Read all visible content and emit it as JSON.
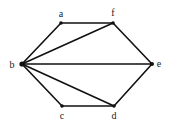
{
  "graph": {
    "vertices": [
      {
        "id": "a",
        "label": "a",
        "x": 61,
        "y": 23,
        "lx": 61,
        "ly": 17,
        "r": 1.8
      },
      {
        "id": "f",
        "label": "f",
        "x": 113,
        "y": 23,
        "lx": 113,
        "ly": 16,
        "r": 1.8
      },
      {
        "id": "b",
        "label": "b",
        "x": 22,
        "y": 64,
        "lx": 12,
        "ly": 68,
        "r": 2.6
      },
      {
        "id": "e",
        "label": "e",
        "x": 152,
        "y": 64,
        "lx": 159,
        "ly": 67,
        "r": 2.0
      },
      {
        "id": "c",
        "label": "c",
        "x": 62,
        "y": 106,
        "lx": 62,
        "ly": 119,
        "r": 1.8
      },
      {
        "id": "d",
        "label": "d",
        "x": 114,
        "y": 106,
        "lx": 114,
        "ly": 119,
        "r": 1.8
      }
    ],
    "edges": [
      [
        "a",
        "f"
      ],
      [
        "a",
        "b"
      ],
      [
        "b",
        "f"
      ],
      [
        "b",
        "e"
      ],
      [
        "b",
        "c"
      ],
      [
        "b",
        "d"
      ],
      [
        "c",
        "d"
      ],
      [
        "d",
        "e"
      ],
      [
        "f",
        "e"
      ]
    ]
  },
  "labels": {
    "a": "a",
    "b": "b",
    "c": "c",
    "d": "d",
    "e": "e",
    "f": "f"
  }
}
